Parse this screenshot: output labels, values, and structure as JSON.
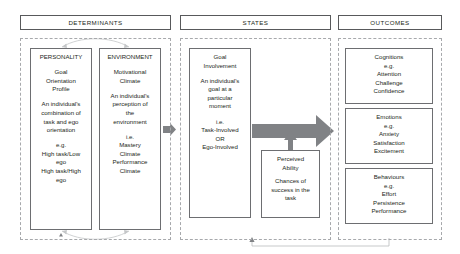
{
  "diagram": {
    "columns": [
      {
        "key": "determinants",
        "header": "DETERMINANTS"
      },
      {
        "key": "states",
        "header": "STATES"
      },
      {
        "key": "outcomes",
        "header": "OUTCOMES"
      }
    ],
    "determinants": {
      "personality": {
        "title": "PERSONALITY",
        "concept": "Goal\nOrientation\nProfile",
        "definition": "An individual's\ncombination of\ntask and ego\norientation",
        "examples_label": "e.g.",
        "examples": "High task/Low\nego\nHigh task/High\nego"
      },
      "environment": {
        "title": "ENVIRONMENT",
        "concept": "Motivational\nClimate",
        "definition": "An individual's\nperception of\nthe\nenvironment",
        "examples_label": "i.e.",
        "examples": "Mastery\nClimate\nPerformance\nClimate"
      }
    },
    "states": {
      "goal_involvement": {
        "title": "Goal\nInvolvement",
        "definition": "An individual's\ngoal at a\nparticular\nmoment",
        "examples_label": "i.e.",
        "examples": "Task-Involved\nOR\nEgo-Involved"
      },
      "perceived_ability": {
        "title": "Perceived\nAbility",
        "definition": "Chances of\nsuccess in the\ntask"
      }
    },
    "outcomes": [
      {
        "title": "Cognitions",
        "examples_label": "e.g.",
        "examples": "Attention\nChallenge\nConfidence"
      },
      {
        "title": "Emotions",
        "examples_label": "e.g.",
        "examples": "Anxiety\nSatisfaction\nExcitement"
      },
      {
        "title": "Behaviours",
        "examples_label": "e.g.",
        "examples": "Effort\nPersistence\nPerformance"
      }
    ],
    "connectors": [
      {
        "name": "determinants-to-states-arrow",
        "kind": "small-gray-right-arrow"
      },
      {
        "name": "states-to-outcomes-arrow",
        "kind": "large-gray-right-arrow"
      },
      {
        "name": "perceived-ability-up-arrow",
        "kind": "gray-up-arrow"
      },
      {
        "name": "personality-environment-link",
        "kind": "thin-curved-double-arrow"
      },
      {
        "name": "outcomes-feedback-loop",
        "kind": "thin-line-with-up-arrow"
      }
    ],
    "colors": {
      "arrow_gray": "#808285",
      "box_border": "#6d6e71",
      "group_border": "#a7a9ac",
      "header_border": "#58595b",
      "text": "#231f20",
      "background": "#ffffff",
      "thin_line": "#b9bbbd"
    }
  }
}
